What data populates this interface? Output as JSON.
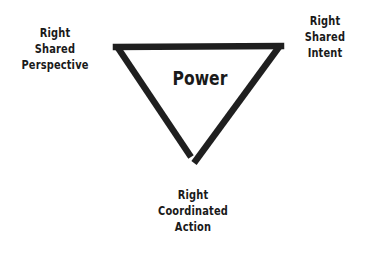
{
  "diagram": {
    "type": "inverted-triangle",
    "center_label": "Power",
    "stroke_color": "#1f1f1f",
    "background_color": "#ffffff",
    "vertices": {
      "top_left": {
        "lines": [
          "Right",
          "Shared",
          "Perspective"
        ]
      },
      "top_right": {
        "lines": [
          "Right",
          "Shared",
          "Intent"
        ]
      },
      "bottom": {
        "lines": [
          "Right",
          "Coordinated",
          "Action"
        ]
      }
    }
  }
}
